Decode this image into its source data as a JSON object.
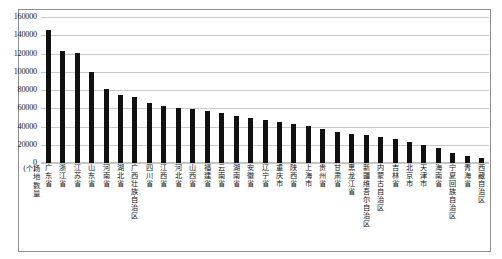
{
  "chart_data": {
    "type": "bar",
    "title": "",
    "xlabel": "",
    "ylabel": "场地数量(个)",
    "ylabel_chars": "场地数量(个)",
    "ylim": [
      0,
      160000
    ],
    "ytick_step": 20000,
    "grid": true,
    "legend": "none",
    "bar_color": "#111111",
    "grid_color": "#c9c9c9",
    "yticks": [
      "160000",
      "140000",
      "120000",
      "100000",
      "80000",
      "60000",
      "40000",
      "20000",
      "0"
    ],
    "ytick_values": [
      160000,
      140000,
      120000,
      100000,
      80000,
      60000,
      40000,
      20000,
      0
    ],
    "categories": [
      "广东省",
      "浙江省",
      "江苏省",
      "山东省",
      "河南省",
      "湖北省",
      "广西壮族自治区",
      "四川省",
      "江西省",
      "河北省",
      "山西省",
      "福建省",
      "云南省",
      "湖南省",
      "安徽省",
      "辽宁省",
      "重庆市",
      "陕西省",
      "上海市",
      "贵州省",
      "甘肃省",
      "黑龙江省",
      "新疆维吾尔自治区",
      "内蒙古自治区",
      "吉林省",
      "北京市",
      "天津市",
      "海南省",
      "宁夏回族自治区",
      "青海省",
      "西藏自治区"
    ],
    "values": [
      146000,
      123000,
      121000,
      100000,
      81000,
      74000,
      72000,
      66000,
      62000,
      60000,
      59000,
      57000,
      55000,
      52000,
      49000,
      47000,
      45000,
      43000,
      41000,
      37000,
      34000,
      32000,
      31000,
      29000,
      26000,
      23000,
      20000,
      17000,
      11000,
      8000,
      5000
    ]
  }
}
